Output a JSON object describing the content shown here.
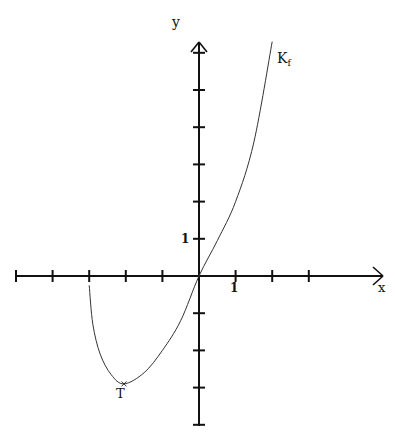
{
  "chart_data": {
    "type": "line",
    "title": "",
    "xlabel": "x",
    "ylabel": "y",
    "curve_label": "K_f",
    "curve_label_main": "K",
    "curve_label_sub": "f",
    "point_label": "T",
    "tick_label_x": "1",
    "tick_label_y": "1",
    "xlim": [
      -5,
      5
    ],
    "ylim": [
      -4,
      6.5
    ],
    "x_ticks": [
      -5,
      -4,
      -3,
      -2,
      -1,
      1,
      2,
      3
    ],
    "y_ticks": [
      -4,
      -3,
      -2,
      -1,
      1,
      2,
      3,
      4,
      5,
      6
    ],
    "grid": false,
    "series": [
      {
        "name": "K_f",
        "x": [
          -3,
          -2.9,
          -2.7,
          -2.4,
          -2.05,
          -1.5,
          -1,
          -0.5,
          0,
          0.5,
          1,
          1.5,
          2
        ],
        "y": [
          -0.25,
          -1.3,
          -2.1,
          -2.65,
          -2.9,
          -2.6,
          -2.0,
          -1.2,
          0,
          0.95,
          2.0,
          3.6,
          6.3
        ]
      }
    ],
    "annotations": [
      {
        "label": "T",
        "x": -2.05,
        "y": -2.9,
        "note": "minimum point"
      }
    ],
    "colors": {
      "axis": "#111111",
      "curve": "#333333",
      "background": "#ffffff"
    }
  }
}
